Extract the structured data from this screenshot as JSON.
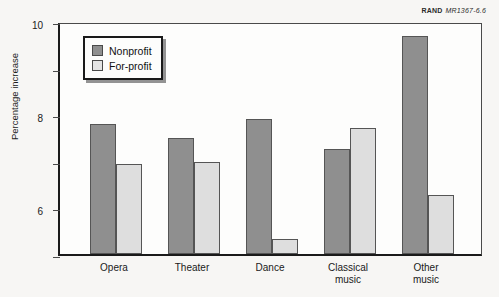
{
  "credit": {
    "organization": "RAND",
    "document_id": "MR1367-6.6"
  },
  "legend": {
    "items": [
      {
        "label": "Nonprofit",
        "color": "#8f8f8f",
        "key": "nonprofit"
      },
      {
        "label": "For-profit",
        "color": "#dedede",
        "key": "forprofit"
      }
    ]
  },
  "axes": {
    "y_title": "Percentage increase",
    "y_ticks": [
      "0",
      "2",
      "4",
      "6",
      "8",
      "10"
    ]
  },
  "chart_data": {
    "type": "bar",
    "title": "",
    "xlabel": "",
    "ylabel": "Percentage increase",
    "ylim": [
      0,
      10
    ],
    "ytick_step": 2,
    "grid": false,
    "legend_position": "top-left-inside",
    "categories": [
      "Opera",
      "Theater",
      "Dance",
      "Classical music",
      "Other music"
    ],
    "category_lines": [
      [
        "Opera"
      ],
      [
        "Theater"
      ],
      [
        "Dance"
      ],
      [
        "Classical",
        "music"
      ],
      [
        "Other",
        "music"
      ]
    ],
    "series": [
      {
        "name": "Nonprofit",
        "color": "#8f8f8f",
        "values": [
          5.6,
          5.0,
          5.8,
          4.5,
          9.35
        ]
      },
      {
        "name": "For-profit",
        "color": "#dedede",
        "values": [
          3.85,
          3.95,
          0.65,
          5.4,
          2.55
        ]
      }
    ]
  }
}
